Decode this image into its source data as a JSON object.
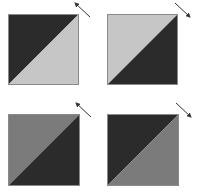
{
  "colors": {
    "background": "#ffffff",
    "dark": "#2b2b2b",
    "light": "#c6c6c6",
    "medium": "#7b7b7b",
    "border": "#8a8a8a",
    "arrow": "#333333"
  },
  "panels": [
    {
      "id": "top-left",
      "upper_left_triangle": "dark",
      "lower_right_triangle": "light",
      "arrow_direction": "up-left"
    },
    {
      "id": "top-right",
      "upper_left_triangle": "light",
      "lower_right_triangle": "dark",
      "arrow_direction": "down-right"
    },
    {
      "id": "bottom-left",
      "upper_left_triangle": "medium",
      "lower_right_triangle": "dark",
      "arrow_direction": "up-left"
    },
    {
      "id": "bottom-right",
      "upper_left_triangle": "dark",
      "lower_right_triangle": "medium",
      "arrow_direction": "down-right"
    }
  ]
}
